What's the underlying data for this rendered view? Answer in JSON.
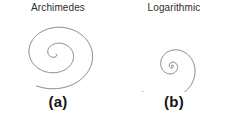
{
  "figure": {
    "background_color": "#ffffff",
    "stroke_color": "#6a6a6a",
    "text_color": "#2e2e2e",
    "caption_color": "#151515"
  },
  "panels": [
    {
      "id": "archimedes",
      "title": "Archimedes",
      "caption": "(a)"
    },
    {
      "id": "logarithmic",
      "title": "Logarithmic",
      "caption": "(b)"
    }
  ],
  "chart_data": {
    "type": "line",
    "series": [
      {
        "name": "Archimedes",
        "panel": "archimedes",
        "equation": "r = a + b*theta",
        "params": {
          "a": 0.0,
          "b": 3.05
        },
        "theta_start": 0.0,
        "theta_end": 14.0,
        "rotation_deg": 35,
        "center": {
          "x": 56,
          "y": 40
        },
        "squash_y": 0.84,
        "direction": "counterclockwise"
      },
      {
        "name": "Logarithmic",
        "panel": "logarithmic",
        "equation": "r = a * exp(b*theta)",
        "params": {
          "a": 0.62,
          "b": 0.226
        },
        "theta_start": 0.0,
        "theta_end": 18.3,
        "rotation_deg": 170,
        "center": {
          "x": 56,
          "y": 52
        },
        "squash_y": 1.0,
        "direction": "counterclockwise"
      }
    ],
    "xlabel": "",
    "ylabel": "",
    "grid": false,
    "legend": "none"
  }
}
